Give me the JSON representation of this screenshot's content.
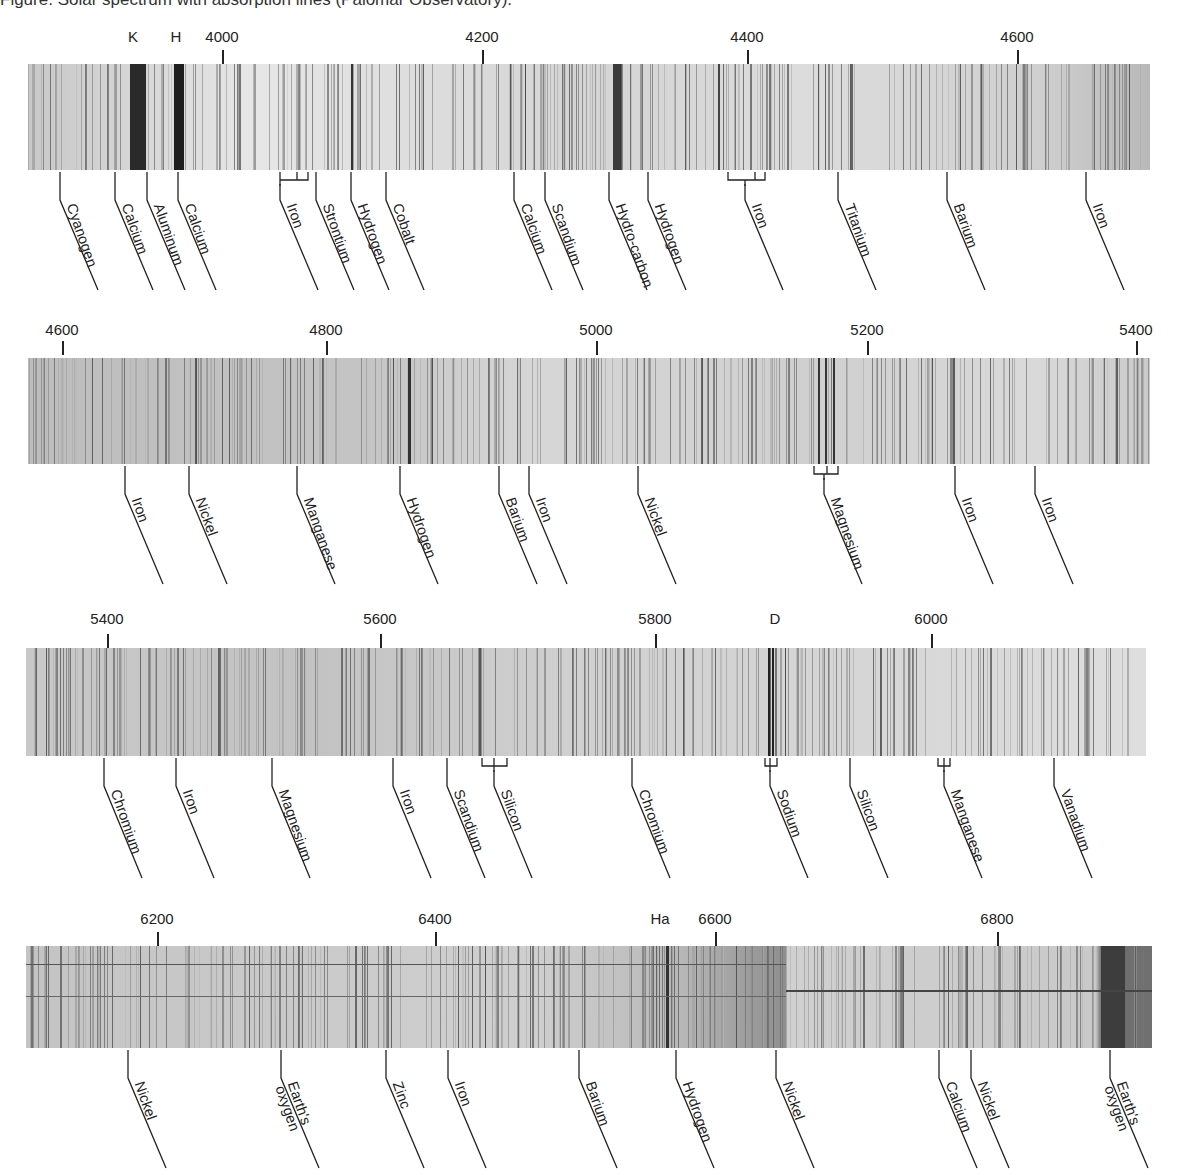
{
  "caption": "Figure: Solar spectrum with absorption lines (Palomar Observatory).",
  "panels": [
    {
      "id": "panel-1",
      "range": [
        3880,
        4700
      ],
      "ticks": [
        {
          "label": "K",
          "x": 133
        },
        {
          "label": "H",
          "x": 176
        },
        {
          "label": "4000",
          "x": 222,
          "mark": true
        },
        {
          "label": "4200",
          "x": 482,
          "mark": true
        },
        {
          "label": "4400",
          "x": 747,
          "mark": true
        },
        {
          "label": "4600",
          "x": 1017,
          "mark": true
        }
      ],
      "labels": [
        {
          "text": "Cyanogen",
          "x": 60
        },
        {
          "text": "Calcium",
          "x": 115
        },
        {
          "text": "Aluminum",
          "x": 147
        },
        {
          "text": "Calcium",
          "x": 178
        },
        {
          "text": "Iron",
          "x": 280,
          "bracket": [
            280,
            297,
            308
          ]
        },
        {
          "text": "Strontium",
          "x": 316
        },
        {
          "text": "Hydrogen",
          "x": 351
        },
        {
          "text": "Cobalt",
          "x": 386
        },
        {
          "text": "Calcium",
          "x": 514
        },
        {
          "text": "Scandium",
          "x": 545
        },
        {
          "text": "Hydro-carbon",
          "x": 609
        },
        {
          "text": "Hydrogen",
          "x": 648
        },
        {
          "text": "Iron",
          "x": 745,
          "bracket": [
            728,
            755,
            765
          ]
        },
        {
          "text": "Titanium",
          "x": 838
        },
        {
          "text": "Barium",
          "x": 947
        },
        {
          "text": "Iron",
          "x": 1086
        }
      ]
    },
    {
      "id": "panel-2",
      "range": [
        4580,
        5420
      ],
      "ticks": [
        {
          "label": "4600",
          "x": 62,
          "mark": true
        },
        {
          "label": "4800",
          "x": 326,
          "mark": true
        },
        {
          "label": "5000",
          "x": 596,
          "mark": true
        },
        {
          "label": "5200",
          "x": 867,
          "mark": true
        },
        {
          "label": "5400",
          "x": 1136,
          "mark": true
        }
      ],
      "labels": [
        {
          "text": "Iron",
          "x": 125
        },
        {
          "text": "Nickel",
          "x": 189
        },
        {
          "text": "Manganese",
          "x": 297
        },
        {
          "text": "Hydrogen",
          "x": 400
        },
        {
          "text": "Barium",
          "x": 499
        },
        {
          "text": "Iron",
          "x": 529
        },
        {
          "text": "Nickel",
          "x": 638
        },
        {
          "text": "Magnesium",
          "x": 824,
          "bracket": [
            814,
            827,
            838
          ]
        },
        {
          "text": "Iron",
          "x": 955
        },
        {
          "text": "Iron",
          "x": 1035
        }
      ]
    },
    {
      "id": "panel-3",
      "range": [
        5380,
        6210
      ],
      "ticks": [
        {
          "label": "5400",
          "x": 107,
          "mark": true
        },
        {
          "label": "5600",
          "x": 380,
          "mark": true
        },
        {
          "label": "5800",
          "x": 655,
          "mark": true
        },
        {
          "label": "D",
          "x": 775
        },
        {
          "label": "6000",
          "x": 931,
          "mark": true
        }
      ],
      "labels": [
        {
          "text": "Chromium",
          "x": 104
        },
        {
          "text": "Iron",
          "x": 176
        },
        {
          "text": "Magnesium",
          "x": 272
        },
        {
          "text": "Iron",
          "x": 393
        },
        {
          "text": "Scandium",
          "x": 447
        },
        {
          "text": "Silicon",
          "x": 494,
          "bracket": [
            482,
            494,
            507
          ]
        },
        {
          "text": "Chromium",
          "x": 632
        },
        {
          "text": "Sodium",
          "x": 770,
          "bracket": [
            765,
            770,
            777
          ]
        },
        {
          "text": "Silicon",
          "x": 850
        },
        {
          "text": "Manganese",
          "x": 944,
          "bracket": [
            938,
            944,
            950
          ]
        },
        {
          "text": "Vanadium",
          "x": 1054
        }
      ]
    },
    {
      "id": "panel-4",
      "range": [
        6100,
        6960
      ],
      "ticks": [
        {
          "label": "6200",
          "x": 157,
          "mark": true
        },
        {
          "label": "6400",
          "x": 435,
          "mark": true
        },
        {
          "label": "Ha",
          "x": 660
        },
        {
          "label": "6600",
          "x": 715,
          "mark": true
        },
        {
          "label": "6800",
          "x": 997,
          "mark": true
        }
      ],
      "labels": [
        {
          "text": "Nickel",
          "x": 128
        },
        {
          "text": "Earth's\noxygen",
          "x": 281
        },
        {
          "text": "Zinc",
          "x": 386
        },
        {
          "text": "Iron",
          "x": 448
        },
        {
          "text": "Barium",
          "x": 579
        },
        {
          "text": "Hydrogen",
          "x": 676
        },
        {
          "text": "Nickel",
          "x": 776
        },
        {
          "text": "Calcium",
          "x": 939
        },
        {
          "text": "Nickel",
          "x": 971
        },
        {
          "text": "Earth's\noxygen",
          "x": 1110
        }
      ]
    }
  ],
  "chart_data": {
    "type": "spectrum",
    "title": "Solar spectrum with absorption lines (Palomar Observatory)",
    "xlabel": "Wavelength (Å)",
    "panels": [
      {
        "ticks": [
          4000,
          4200,
          4400,
          4600
        ],
        "markers": [
          "K",
          "H"
        ],
        "lines": [
          "Cyanogen",
          "Calcium",
          "Aluminum",
          "Calcium",
          "Iron",
          "Strontium",
          "Hydrogen",
          "Cobalt",
          "Calcium",
          "Scandium",
          "Hydro-carbon",
          "Hydrogen",
          "Iron",
          "Titanium",
          "Barium",
          "Iron"
        ]
      },
      {
        "ticks": [
          4600,
          4800,
          5000,
          5200,
          5400
        ],
        "lines": [
          "Iron",
          "Nickel",
          "Manganese",
          "Hydrogen",
          "Barium",
          "Iron",
          "Nickel",
          "Magnesium",
          "Iron",
          "Iron"
        ]
      },
      {
        "ticks": [
          5400,
          5600,
          5800,
          6000
        ],
        "markers": [
          "D"
        ],
        "lines": [
          "Chromium",
          "Iron",
          "Magnesium",
          "Iron",
          "Scandium",
          "Silicon",
          "Chromium",
          "Sodium",
          "Silicon",
          "Manganese",
          "Vanadium"
        ]
      },
      {
        "ticks": [
          6200,
          6400,
          6600,
          6800
        ],
        "markers": [
          "Ha"
        ],
        "lines": [
          "Nickel",
          "Earth's oxygen",
          "Zinc",
          "Iron",
          "Barium",
          "Hydrogen",
          "Nickel",
          "Calcium",
          "Nickel",
          "Earth's oxygen"
        ]
      }
    ]
  }
}
